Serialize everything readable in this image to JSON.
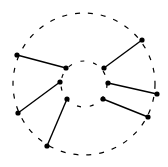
{
  "diagram": {
    "width": 168,
    "height": 167,
    "stroke_color": "#000000",
    "background": "#ffffff",
    "outer_circle": {
      "cx": 84,
      "cy": 84,
      "r": 71,
      "style": "dashed"
    },
    "inner_circle": {
      "cx": 84,
      "cy": 84,
      "r": 23,
      "style": "dashed"
    },
    "edges": [
      {
        "from": [
          17,
          55
        ],
        "to": [
          66,
          68
        ]
      },
      {
        "from": [
          142,
          40
        ],
        "to": [
          104,
          68
        ]
      },
      {
        "from": [
          18,
          113
        ],
        "to": [
          60,
          82
        ]
      },
      {
        "from": [
          157,
          94
        ],
        "to": [
          108,
          83
        ]
      },
      {
        "from": [
          47,
          146
        ],
        "to": [
          67,
          99
        ]
      },
      {
        "from": [
          148,
          117
        ],
        "to": [
          103,
          99
        ]
      }
    ]
  }
}
